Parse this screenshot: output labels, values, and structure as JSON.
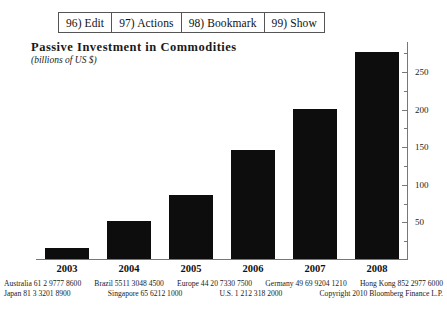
{
  "toolbar": {
    "items": [
      {
        "label": "96) Edit",
        "name": "toolbar-item-edit"
      },
      {
        "label": "97) Actions",
        "name": "toolbar-item-actions"
      },
      {
        "label": "98) Bookmark",
        "name": "toolbar-item-bookmark"
      },
      {
        "label": "99) Show",
        "name": "toolbar-item-show"
      }
    ]
  },
  "chart_data": {
    "type": "bar",
    "title": "Passive Investment in Commodities",
    "subtitle": "(billions of US $)",
    "xlabel": "",
    "ylabel": "billions of US $",
    "categories": [
      "2003",
      "2004",
      "2005",
      "2006",
      "2007",
      "2008"
    ],
    "values": [
      22,
      68,
      118,
      198,
      268,
      375
    ],
    "values_axis": [
      15,
      50,
      85,
      145,
      200,
      275
    ],
    "ylim": [
      0,
      290
    ],
    "yticks": [
      50,
      100,
      150,
      200,
      250
    ],
    "ytick_labels": [
      "50",
      "100",
      "150",
      "200",
      "250"
    ],
    "minor_tick_step": 25,
    "grid": false,
    "legend": "none",
    "bar_color": "#0d0d0d",
    "axis_color": "#777777"
  },
  "footer": {
    "line1": [
      "Australia   61  2 9777  8600",
      "Brazil   5511 3048 4500",
      "Europe 44  20 7330 7500",
      "Germany 49 69 9204 1210",
      "Hong Kong 852 2977 6000"
    ],
    "line2": [
      "Japan 81  3 3201 8900",
      "Singapore  65 6212 1000",
      "U.S.  1  212   318  2000",
      "Copyright 2010 Bloomberg Finance L.P."
    ]
  }
}
